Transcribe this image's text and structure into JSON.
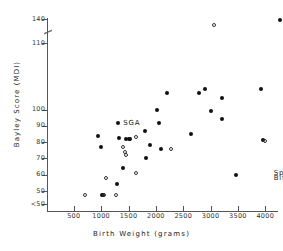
{
  "chart_data": {
    "type": "scatter",
    "title": "",
    "xlabel": "Birth Weight (grams)",
    "ylabel": "Bayley Score (MDI)",
    "xlim": [
      0,
      4600
    ],
    "ylim": [
      45,
      142
    ],
    "grid": false,
    "legend": "none",
    "axis_break": {
      "axis": "y",
      "between": [
        110,
        140
      ],
      "symbol": "//"
    },
    "xticks": [
      500,
      1000,
      1500,
      2000,
      2500,
      3000,
      3500,
      4000,
      4500
    ],
    "yticks": [
      "<50",
      "50",
      "60",
      "70",
      "80",
      "90",
      "100",
      "110",
      "140"
    ],
    "annotations": [
      {
        "text": "SGA",
        "x": 1330,
        "y": 92
      },
      {
        "text": "Spina",
        "x": 4080,
        "y": 61
      },
      {
        "text": "Bifida",
        "x": 4080,
        "y": 58
      }
    ],
    "series": [
      {
        "name": "filled",
        "marker": "filled-circle",
        "color": "#111111",
        "points": [
          {
            "x": 950,
            "y": 83.5
          },
          {
            "x": 1000,
            "y": 77
          },
          {
            "x": 1300,
            "y": 92
          },
          {
            "x": 1330,
            "y": 82.5
          },
          {
            "x": 1450,
            "y": 82
          },
          {
            "x": 1500,
            "y": 82
          },
          {
            "x": 1530,
            "y": 82
          },
          {
            "x": 1400,
            "y": 64
          },
          {
            "x": 1280,
            "y": 54
          },
          {
            "x": 1800,
            "y": 87
          },
          {
            "x": 1820,
            "y": 70
          },
          {
            "x": 1900,
            "y": 78
          },
          {
            "x": 2020,
            "y": 100
          },
          {
            "x": 2060,
            "y": 92
          },
          {
            "x": 2100,
            "y": 76
          },
          {
            "x": 2200,
            "y": 110
          },
          {
            "x": 2650,
            "y": 85
          },
          {
            "x": 2780,
            "y": 110
          },
          {
            "x": 2900,
            "y": 112.5
          },
          {
            "x": 3000,
            "y": 99
          },
          {
            "x": 3200,
            "y": 107
          },
          {
            "x": 3210,
            "y": 94
          },
          {
            "x": 3470,
            "y": 60
          },
          {
            "x": 3930,
            "y": 112.5
          },
          {
            "x": 3950,
            "y": 81
          },
          {
            "x": 4260,
            "y": 139
          },
          {
            "x": 1020,
            "y": 47.5
          },
          {
            "x": 1040,
            "y": 47.5
          }
        ]
      },
      {
        "name": "open",
        "marker": "open-circle",
        "color": "#333333",
        "points": [
          {
            "x": 1400,
            "y": 77
          },
          {
            "x": 1440,
            "y": 74
          },
          {
            "x": 1450,
            "y": 72
          },
          {
            "x": 1630,
            "y": 83
          },
          {
            "x": 1640,
            "y": 61
          },
          {
            "x": 2270,
            "y": 76
          },
          {
            "x": 1080,
            "y": 58
          },
          {
            "x": 710,
            "y": 47.5
          },
          {
            "x": 1060,
            "y": 47.5
          },
          {
            "x": 1270,
            "y": 47.5
          },
          {
            "x": 3990,
            "y": 80.5
          },
          {
            "x": 4370,
            "y": 55
          },
          {
            "x": 3060,
            "y": 129
          }
        ]
      }
    ]
  }
}
